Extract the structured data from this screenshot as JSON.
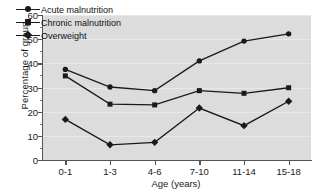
{
  "chart_data": {
    "type": "line",
    "title": "",
    "xlabel": "Age (years)",
    "ylabel": "Percentage of group",
    "categories": [
      "0-1",
      "1-3",
      "4-6",
      "7-10",
      "11-14",
      "15-18"
    ],
    "ylim": [
      0,
      60
    ],
    "yticks": [
      0,
      10,
      20,
      30,
      40,
      50,
      60
    ],
    "ytick_labels": [
      "0",
      "10",
      "20",
      "30",
      "40",
      "50",
      "60"
    ],
    "grid": true,
    "legend_position": "top-left",
    "series": [
      {
        "name": "Acute malnutrition",
        "marker": "circle",
        "color": "#1a1a1a",
        "values": [
          37.5,
          30.2,
          28.7,
          41.0,
          49.2,
          52.2
        ]
      },
      {
        "name": "Chronic malnutrition",
        "marker": "square",
        "color": "#1a1a1a",
        "values": [
          34.8,
          23.1,
          22.8,
          28.7,
          27.6,
          29.9
        ]
      },
      {
        "name": "Overweight",
        "marker": "diamond",
        "color": "#1a1a1a",
        "values": [
          16.8,
          6.3,
          7.3,
          21.5,
          14.2,
          24.3
        ]
      }
    ],
    "plot_background": "#dcdcdc",
    "figure_background": "#ffffff",
    "axis_color": "#555555",
    "gridline_color": "#e8e8e8"
  }
}
